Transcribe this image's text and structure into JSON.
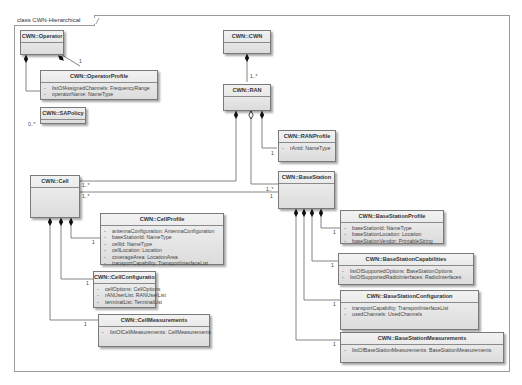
{
  "frame": {
    "title": "class CWN-Hierarchical"
  },
  "classes": {
    "operator": {
      "name": "CWN::Operator",
      "attributes": []
    },
    "operator_profile": {
      "name": "CWN::OperatorProfile",
      "attributes": [
        {
          "vis": "-",
          "text": "listOfAssignedChannels:  FrequencyRange"
        },
        {
          "vis": "-",
          "text": "operatorName:  NameType"
        }
      ]
    },
    "sa_policy": {
      "name": "CWN::SAPolicy",
      "attributes": []
    },
    "cwn": {
      "name": "CWN::CWN",
      "attributes": []
    },
    "ran": {
      "name": "CWN::RAN",
      "attributes": []
    },
    "ran_profile": {
      "name": "CWN::RANProfile",
      "attributes": [
        {
          "vis": "-",
          "text": "rAntd:  NameType"
        }
      ]
    },
    "cell": {
      "name": "CWN::Cell",
      "attributes": []
    },
    "base_station": {
      "name": "CWN::BaseStation",
      "attributes": []
    },
    "cell_profile": {
      "name": "CWN::CellProfile",
      "attributes": [
        {
          "vis": "-",
          "text": "antennaConfiguration:  AntennaConfiguration"
        },
        {
          "vis": "-",
          "text": "baseStationId:  NameType"
        },
        {
          "vis": "-",
          "text": "cellId:  NameType"
        },
        {
          "vis": "-",
          "text": "cellLocation:  Location"
        },
        {
          "vis": "-",
          "text": "coverageArea:  LocationArea"
        },
        {
          "vis": "-",
          "text": "transportCapability:  TransportInterfaceList"
        }
      ]
    },
    "cell_configuration": {
      "name": "CWN::CellConfiguration",
      "attributes": [
        {
          "vis": "-",
          "text": "cellOptions:  CellOptions"
        },
        {
          "vis": "-",
          "text": "rANUserList:  RANUserList"
        },
        {
          "vis": "-",
          "text": "terminalList:  TerminalList"
        }
      ]
    },
    "cell_measurements": {
      "name": "CWN::CellMeasurements",
      "attributes": [
        {
          "vis": "-",
          "text": "listOfCellMeasurements:  CellMeasurements"
        }
      ]
    },
    "bs_profile": {
      "name": "CWN::BaseStationProfile",
      "attributes": [
        {
          "vis": "-",
          "text": "baseStationId:  NameType"
        },
        {
          "vis": "-",
          "text": "baseStationLocation:  Location"
        },
        {
          "vis": "-",
          "text": "baseStationVendor:  PrintableString"
        }
      ]
    },
    "bs_capabilities": {
      "name": "CWN::BaseStationCapabilities",
      "attributes": [
        {
          "vis": "-",
          "text": "listOfSupportedOptions:  BaseStationOptions"
        },
        {
          "vis": "-",
          "text": "listOfSupportedRadioInterfaces:  RadioInterfaces"
        }
      ]
    },
    "bs_configuration": {
      "name": "CWN::BaseStationConfiguration",
      "attributes": [
        {
          "vis": "-",
          "text": "transportCapability:  TransportInterfaceList"
        },
        {
          "vis": "-",
          "text": "usedChannels:  UsedChannels"
        }
      ]
    },
    "bs_measurements": {
      "name": "CWN::BaseStationMeasurements",
      "attributes": [
        {
          "vis": "-",
          "text": "listOfBaseStationMeasurements:  BaseStationMeasurements"
        }
      ]
    }
  },
  "multiplicities": {
    "operator_profile": "1",
    "sa_policy": "0..*",
    "cwn_ran": "1..*",
    "ran_profile": "1",
    "ran_bs": "1..*",
    "cell_to_ran": "1..*",
    "cell_to_bs": "1..*",
    "bs_to_cell_upper": "1..*",
    "bs_to_cell_lower": "1",
    "cell_profile": "1",
    "cell_configuration": "1",
    "cell_measurements": "1",
    "bs_profile": "1",
    "bs_capabilities": "1",
    "bs_configuration": "1",
    "bs_measurements": "1"
  }
}
